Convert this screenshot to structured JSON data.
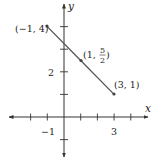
{
  "chart_data": {
    "type": "line",
    "title": "",
    "xlabel": "x",
    "ylabel": "y",
    "xlim": [
      -1.5,
      4.5
    ],
    "ylim": [
      -2,
      4.5
    ],
    "grid": false,
    "x_ticks": [
      -2,
      -1,
      1,
      2,
      3,
      4
    ],
    "y_ticks": [
      -1,
      1,
      2,
      3,
      4
    ],
    "x_tick_labels": [
      {
        "value": -1,
        "label": "−1"
      },
      {
        "value": 3,
        "label": "3"
      }
    ],
    "y_tick_labels": [
      {
        "value": 2,
        "label": "2"
      }
    ],
    "series": [
      {
        "name": "segment",
        "color": "#555555",
        "x": [
          -1,
          1,
          3
        ],
        "y": [
          4,
          2.5,
          1
        ]
      }
    ],
    "annotations": [
      {
        "x": -1,
        "y": 4,
        "label": "(−1, 4)"
      },
      {
        "x": 1,
        "y": 2.5,
        "label": "(1, 5/2)",
        "label_parts": {
          "open": "(1, ",
          "num": "5",
          "den": "2",
          "close": ")"
        }
      },
      {
        "x": 3,
        "y": 1,
        "label": "(3, 1)"
      }
    ]
  },
  "colors": {
    "axis": "#333333",
    "line": "#555555",
    "point": "#444444"
  }
}
